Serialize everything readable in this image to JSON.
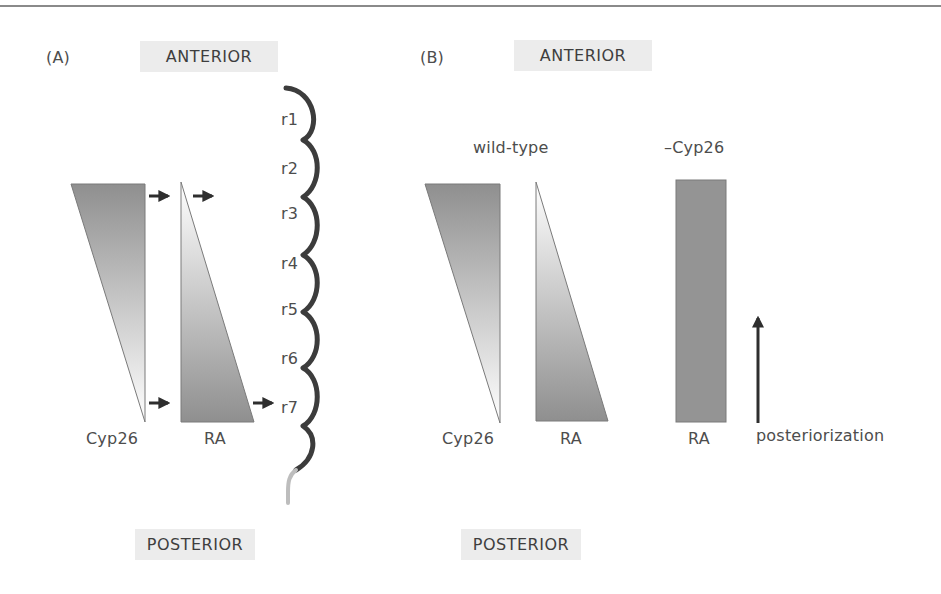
{
  "figure": {
    "panel_a": {
      "label": "(A)",
      "anterior_label": "ANTERIOR",
      "posterior_label": "POSTERIOR",
      "gradients": [
        {
          "name": "Cyp26",
          "label": "Cyp26",
          "high_end": "anterior"
        },
        {
          "name": "RA",
          "label": "RA",
          "high_end": "posterior"
        }
      ],
      "rhombomeres": [
        "r1",
        "r2",
        "r3",
        "r4",
        "r5",
        "r6",
        "r7"
      ]
    },
    "panel_b": {
      "label": "(B)",
      "anterior_label": "ANTERIOR",
      "posterior_label": "POSTERIOR",
      "conditions": [
        {
          "title": "wild-type",
          "gradients": [
            {
              "name": "Cyp26",
              "label": "Cyp26",
              "high_end": "anterior"
            },
            {
              "name": "RA",
              "label": "RA",
              "high_end": "posterior"
            }
          ]
        },
        {
          "title": "–Cyp26",
          "gradients": [
            {
              "name": "RA",
              "label": "RA",
              "high_end": "uniform"
            }
          ]
        }
      ],
      "arrow_label": "posteriorization"
    },
    "colors": {
      "gradient_dark": "#8f8f8f",
      "gradient_light": "#ffffff",
      "uniform_fill": "#949494",
      "hindbrain_line": "#3c3c3c",
      "spinal_line": "#bdbdbd",
      "axis_box": "#ececec",
      "arrow": "#2e2e2e"
    }
  }
}
